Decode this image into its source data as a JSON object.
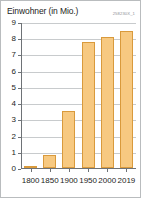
{
  "chart_data": {
    "type": "bar",
    "title": "Einwohner (in Mio.)",
    "code_label": "258230X_1",
    "xlabel": "",
    "ylabel": "Einwohner (in Mio.)",
    "categories": [
      "1800",
      "1850",
      "1900",
      "1950",
      "2000",
      "2019"
    ],
    "values": [
      0.1,
      0.8,
      3.5,
      7.75,
      8.05,
      8.45
    ],
    "ylim": [
      0,
      9
    ],
    "ytick_labels": [
      "0",
      "1",
      "2",
      "3",
      "4",
      "5",
      "6",
      "7",
      "8",
      "9"
    ],
    "ytick_values": [
      0,
      1,
      2,
      3,
      4,
      5,
      6,
      7,
      8,
      9
    ],
    "grid": true,
    "legend": null,
    "bar_fill_color": "#f7c981",
    "bar_border_color": "#d99a3c",
    "axis_color": "#6e7276",
    "grid_color": "#c8cbcd",
    "text_color": "#1d1d1b",
    "border_color": "#b9bcbe"
  }
}
